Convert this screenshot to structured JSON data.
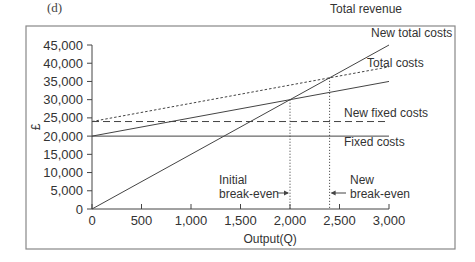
{
  "panel_label": "(d)",
  "chart_data": {
    "type": "line",
    "title": "",
    "xlabel": "Output(Q)",
    "ylabel": "£",
    "xlim": [
      0,
      3000
    ],
    "ylim": [
      0,
      45000
    ],
    "x_ticks": [
      0,
      500,
      1000,
      1500,
      2000,
      2500,
      3000
    ],
    "x_tick_labels": [
      "0",
      "500",
      "1,000",
      "1,500",
      "2,000",
      "2,500",
      "3,000"
    ],
    "y_ticks": [
      0,
      5000,
      10000,
      15000,
      20000,
      25000,
      30000,
      35000,
      40000,
      45000
    ],
    "y_tick_labels": [
      "0",
      "5,000",
      "10,000",
      "15,000",
      "20,000",
      "25,000",
      "30,000",
      "35,000",
      "40,000",
      "45,000"
    ],
    "grid": false,
    "series": [
      {
        "name": "Total revenue",
        "style": "solid",
        "x": [
          0,
          3000
        ],
        "y": [
          0,
          45000
        ]
      },
      {
        "name": "New total costs",
        "style": "dotted",
        "x": [
          0,
          3000
        ],
        "y": [
          24000,
          39000
        ]
      },
      {
        "name": "Total costs",
        "style": "solid",
        "x": [
          0,
          3000
        ],
        "y": [
          20000,
          35000
        ]
      },
      {
        "name": "New fixed costs",
        "style": "dashed",
        "x": [
          0,
          3000
        ],
        "y": [
          24000,
          24000
        ]
      },
      {
        "name": "Fixed costs",
        "style": "solid",
        "x": [
          0,
          3000
        ],
        "y": [
          20000,
          20000
        ]
      }
    ],
    "annotations": [
      {
        "text_lines": [
          "Initial",
          "break-even"
        ],
        "x": 2000,
        "y": 30000
      },
      {
        "text_lines": [
          "New",
          "break-even"
        ],
        "x": 2400,
        "y": 36000
      }
    ]
  }
}
